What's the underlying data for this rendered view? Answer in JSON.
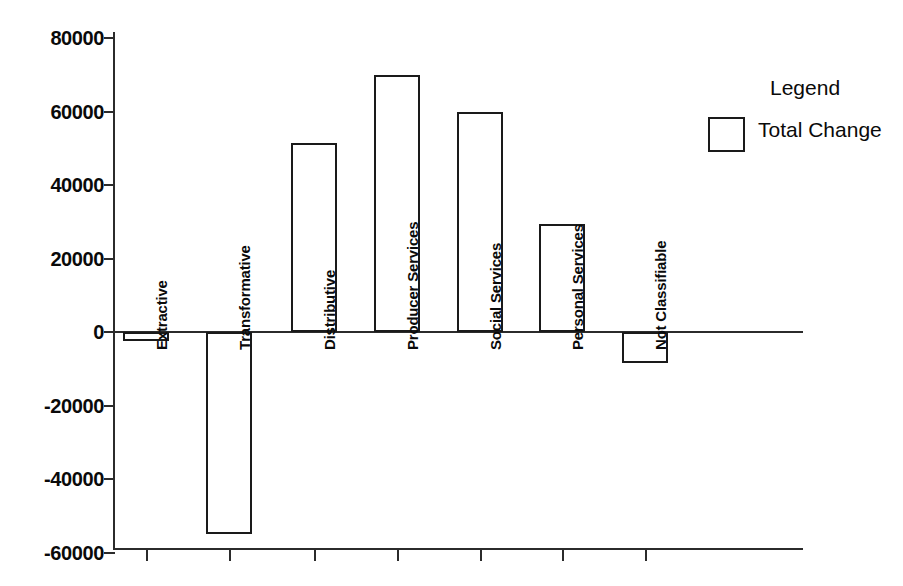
{
  "chart_data": {
    "type": "bar",
    "title": "",
    "subtitle": "",
    "xlabel": "",
    "ylabel": "",
    "categories": [
      "Extractive",
      "Transformative",
      "Distributive",
      "Producer Services",
      "Social Services",
      "Personal Services",
      "Not Classifiable"
    ],
    "series": [
      {
        "name": "Total Change",
        "values": [
          -2500,
          -55000,
          51500,
          70000,
          60000,
          29500,
          -8500
        ]
      }
    ],
    "values": [
      -2500,
      -55000,
      51500,
      70000,
      60000,
      29500,
      -8500
    ],
    "ylim": [
      -60000,
      80000
    ],
    "ytick_values": [
      80000,
      60000,
      40000,
      20000,
      0,
      -20000,
      -40000,
      -60000
    ],
    "ytick_labels": [
      "80000",
      "60000",
      "40000",
      "20000",
      "0",
      "-20000",
      "-40000",
      "-60000"
    ],
    "grid": false,
    "legend_position": "right",
    "bar_fill": "#ffffff",
    "bar_edge": "#1a1a1a",
    "axis_color": "#2b2b2b",
    "background": "#ffffff",
    "category_label_rotation": 90
  },
  "legend": {
    "title": "Legend",
    "entries": [
      {
        "label": "Total Change",
        "swatch_fill": "#ffffff",
        "swatch_edge": "#1a1a1a"
      }
    ]
  },
  "axis": {
    "y_ticks": [
      {
        "label": "80000",
        "value": 80000
      },
      {
        "label": "60000",
        "value": 60000
      },
      {
        "label": "40000",
        "value": 40000
      },
      {
        "label": "20000",
        "value": 20000
      },
      {
        "label": "0",
        "value": 0
      },
      {
        "label": "-20000",
        "value": -20000
      },
      {
        "label": "-40000",
        "value": -40000
      },
      {
        "label": "-60000",
        "value": -60000
      }
    ]
  }
}
